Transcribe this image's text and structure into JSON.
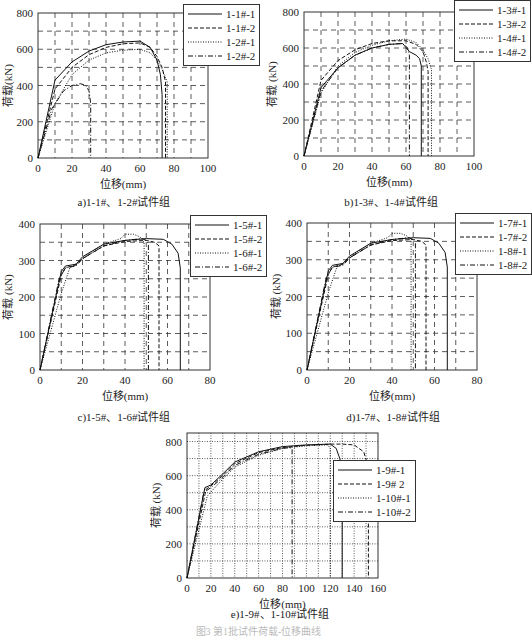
{
  "figure_caption": "图3  第1批试件荷载-位移曲线",
  "chart_data": [
    {
      "id": "a",
      "type": "line",
      "title": "a)1-1#、1-2#试件组",
      "xlabel": "位移(mm)",
      "ylabel": "荷载(kN)",
      "xlim": [
        0,
        100
      ],
      "ylim": [
        0,
        800
      ],
      "xticks": [
        0,
        20,
        40,
        60,
        80,
        100
      ],
      "yticks": [
        0,
        200,
        400,
        600,
        800
      ],
      "grid": "dashed",
      "legend_position": "top-right-outside",
      "series": [
        {
          "name": "1-1#-1",
          "style": "solid",
          "x": [
            0,
            10,
            20,
            30,
            40,
            50,
            60,
            66,
            70,
            72,
            73,
            73
          ],
          "y": [
            0,
            430,
            530,
            590,
            625,
            640,
            645,
            610,
            540,
            460,
            350,
            0
          ]
        },
        {
          "name": "1-1#-2",
          "style": "dashed",
          "x": [
            0,
            10,
            20,
            30,
            40,
            50,
            60,
            66,
            70,
            73,
            75,
            75
          ],
          "y": [
            0,
            380,
            500,
            570,
            610,
            630,
            635,
            610,
            560,
            500,
            420,
            0
          ]
        },
        {
          "name": "1-2#-1",
          "style": "dotted",
          "x": [
            0,
            10,
            20,
            30,
            40,
            50,
            60,
            66,
            70,
            73,
            76,
            76
          ],
          "y": [
            0,
            300,
            460,
            540,
            580,
            595,
            600,
            580,
            540,
            490,
            420,
            0
          ]
        },
        {
          "name": "1-2#-2",
          "style": "dashdot",
          "x": [
            0,
            8,
            15,
            20,
            25,
            28,
            30,
            31,
            31
          ],
          "y": [
            0,
            270,
            370,
            400,
            410,
            400,
            370,
            300,
            0
          ]
        }
      ]
    },
    {
      "id": "b",
      "type": "line",
      "title": "b)1-3#、1-4#试件组",
      "xlabel": "位移(mm)",
      "ylabel": "荷载 (kN)",
      "xlim": [
        0,
        100
      ],
      "ylim": [
        0,
        800
      ],
      "xticks": [
        0,
        20,
        40,
        60,
        80,
        100
      ],
      "yticks": [
        0,
        200,
        400,
        600,
        800
      ],
      "grid": "dashed",
      "legend_position": "top-right-outside",
      "series": [
        {
          "name": "1-3#-1",
          "style": "solid",
          "x": [
            0,
            10,
            20,
            30,
            40,
            50,
            58,
            62,
            66,
            68,
            69,
            69
          ],
          "y": [
            0,
            380,
            490,
            560,
            600,
            620,
            625,
            580,
            560,
            540,
            500,
            0
          ]
        },
        {
          "name": "1-3#-2",
          "style": "dashed",
          "x": [
            0,
            10,
            20,
            30,
            40,
            50,
            60,
            66,
            70,
            72,
            73,
            73
          ],
          "y": [
            0,
            420,
            530,
            590,
            625,
            640,
            640,
            620,
            580,
            520,
            470,
            0
          ]
        },
        {
          "name": "1-4#-1",
          "style": "dotted",
          "x": [
            0,
            10,
            20,
            30,
            40,
            50,
            60,
            66,
            70,
            73,
            75,
            75
          ],
          "y": [
            0,
            350,
            500,
            575,
            615,
            640,
            650,
            630,
            590,
            540,
            480,
            0
          ]
        },
        {
          "name": "1-4#-2",
          "style": "dashdot",
          "x": [
            0,
            10,
            20,
            30,
            40,
            50,
            58,
            61,
            62,
            62
          ],
          "y": [
            0,
            360,
            490,
            560,
            600,
            620,
            625,
            600,
            560,
            0
          ]
        }
      ]
    },
    {
      "id": "c",
      "type": "line",
      "title": "c)1-5#、1-6#试件组",
      "xlabel": "位移(mm)",
      "ylabel": "荷载 (kN)",
      "xlim": [
        0,
        80
      ],
      "ylim": [
        0,
        400
      ],
      "xticks": [
        0,
        20,
        40,
        60,
        80
      ],
      "yticks": [
        0,
        100,
        200,
        300,
        400
      ],
      "grid": "dashed",
      "legend_position": "top-right-outside",
      "series": [
        {
          "name": "1-5#-1",
          "style": "solid",
          "x": [
            0,
            10,
            12,
            17,
            20,
            30,
            40,
            50,
            58,
            62,
            65,
            66,
            66
          ],
          "y": [
            0,
            270,
            285,
            290,
            310,
            345,
            355,
            360,
            358,
            345,
            320,
            280,
            0
          ]
        },
        {
          "name": "1-5#-2",
          "style": "dashed",
          "x": [
            0,
            10,
            12,
            17,
            20,
            30,
            40,
            50,
            54,
            56,
            56
          ],
          "y": [
            0,
            260,
            280,
            288,
            305,
            340,
            352,
            355,
            350,
            340,
            0
          ]
        },
        {
          "name": "1-6#-1",
          "style": "dotted",
          "x": [
            0,
            10,
            14,
            18,
            22,
            30,
            38,
            40,
            44,
            47,
            49,
            49
          ],
          "y": [
            0,
            210,
            280,
            295,
            315,
            345,
            360,
            372,
            372,
            365,
            350,
            0
          ]
        },
        {
          "name": "1-6#-2",
          "style": "dashdot",
          "x": [
            0,
            9,
            12,
            17,
            20,
            30,
            40,
            48,
            50,
            51,
            51
          ],
          "y": [
            0,
            250,
            280,
            285,
            305,
            340,
            355,
            360,
            355,
            345,
            0
          ]
        }
      ]
    },
    {
      "id": "d",
      "type": "line",
      "title": "d)1-7#、1-8#试件组",
      "xlabel": "位移(mm)",
      "ylabel": "荷载 (kN)",
      "xlim": [
        0,
        80
      ],
      "ylim": [
        0,
        400
      ],
      "xticks": [
        0,
        20,
        40,
        60,
        80
      ],
      "yticks": [
        0,
        100,
        200,
        300,
        400
      ],
      "grid": "dashed",
      "legend_position": "top-right-outside",
      "series": [
        {
          "name": "1-7#-1",
          "style": "solid",
          "x": [
            0,
            10,
            12,
            17,
            20,
            30,
            40,
            50,
            58,
            62,
            65,
            66,
            66
          ],
          "y": [
            0,
            270,
            285,
            290,
            310,
            345,
            355,
            360,
            358,
            345,
            320,
            280,
            0
          ]
        },
        {
          "name": "1-7#-2",
          "style": "dashed",
          "x": [
            0,
            10,
            12,
            17,
            20,
            30,
            40,
            50,
            54,
            56,
            56
          ],
          "y": [
            0,
            260,
            280,
            288,
            305,
            340,
            352,
            355,
            350,
            340,
            0
          ]
        },
        {
          "name": "1-8#-1",
          "style": "dotted",
          "x": [
            0,
            10,
            14,
            18,
            22,
            30,
            38,
            40,
            44,
            47,
            49,
            49
          ],
          "y": [
            0,
            210,
            280,
            295,
            315,
            345,
            360,
            372,
            372,
            365,
            350,
            0
          ]
        },
        {
          "name": "1-8#-2",
          "style": "dashdot",
          "x": [
            0,
            9,
            12,
            17,
            20,
            30,
            40,
            48,
            50,
            51,
            51
          ],
          "y": [
            0,
            250,
            280,
            285,
            305,
            340,
            355,
            360,
            355,
            345,
            0
          ]
        }
      ]
    },
    {
      "id": "e",
      "type": "line",
      "title": "e)1-9#、1-10#试件组",
      "xlabel": "位移(mm)",
      "ylabel": "荷载 (kN)",
      "xlim": [
        0,
        160
      ],
      "ylim": [
        0,
        850
      ],
      "xticks": [
        0,
        20,
        40,
        60,
        80,
        100,
        120,
        140,
        160
      ],
      "yticks": [
        0,
        200,
        400,
        600,
        800
      ],
      "grid": "dotted",
      "legend_position": "inside-right",
      "series": [
        {
          "name": "1-9#-1",
          "style": "solid",
          "x": [
            0,
            15,
            20,
            30,
            40,
            60,
            80,
            100,
            120,
            125,
            128,
            130,
            130
          ],
          "y": [
            0,
            530,
            545,
            610,
            680,
            740,
            770,
            780,
            785,
            760,
            700,
            640,
            0
          ]
        },
        {
          "name": "1-9# 2",
          "style": "dashed",
          "x": [
            0,
            16,
            20,
            30,
            40,
            60,
            80,
            100,
            120,
            130,
            140,
            148,
            152,
            152
          ],
          "y": [
            0,
            520,
            540,
            600,
            670,
            735,
            765,
            778,
            785,
            785,
            780,
            740,
            650,
            0
          ]
        },
        {
          "name": "1-10#-1",
          "style": "dotted",
          "x": [
            0,
            17,
            22,
            30,
            40,
            60,
            80,
            100,
            118,
            120,
            120
          ],
          "y": [
            0,
            480,
            520,
            580,
            650,
            720,
            760,
            775,
            780,
            760,
            0
          ]
        },
        {
          "name": "1-10#-2",
          "style": "dashdot",
          "x": [
            0,
            14,
            20,
            30,
            40,
            60,
            80,
            86,
            88,
            88
          ],
          "y": [
            0,
            500,
            530,
            590,
            660,
            725,
            760,
            765,
            760,
            0
          ]
        }
      ]
    }
  ]
}
